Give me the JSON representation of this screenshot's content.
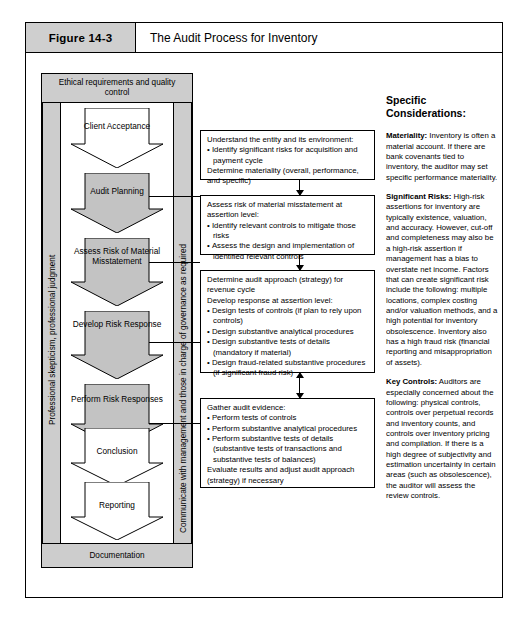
{
  "figure": {
    "number": "Figure 14-3",
    "title": "The Audit Process for Inventory"
  },
  "flow_panel": {
    "top_band": "Ethical requirements and quality control",
    "bottom_band": "Documentation",
    "left_vertical_label": "Professional skepticism, professional judgment",
    "right_vertical_label": "Communicate with management and those in charge of governance as required",
    "steps": [
      {
        "label": "Client Acceptance",
        "fill": "#ffffff"
      },
      {
        "label": "Audit Planning",
        "fill": "#c3c3c3"
      },
      {
        "label": "Assess Risk of Material Misstatement",
        "fill": "#c3c3c3"
      },
      {
        "label": "Develop Risk Response",
        "fill": "#c3c3c3"
      },
      {
        "label": "Perform Risk Responses",
        "fill": "#c3c3c3"
      },
      {
        "label": "Conclusion",
        "fill": "#ffffff"
      },
      {
        "label": "Reporting",
        "fill": "#ffffff"
      }
    ]
  },
  "process_boxes": [
    {
      "lead": "Understand the entity and its environment:",
      "bullets": [
        "Identify significant risks for acquisition and payment cycle"
      ],
      "tail": "Determine materiality (overall, performance, and specific)"
    },
    {
      "lead": "Assess risk of material misstatement at assertion level:",
      "bullets": [
        "Identify relevant controls to mitigate those risks",
        "Assess the design and implementation of identified relevant controls"
      ],
      "tail": ""
    },
    {
      "lead": "Determine audit approach (strategy) for revenue cycle",
      "lead2": "Develop response at assertion level:",
      "bullets": [
        "Design tests of controls (if plan to rely upon controls)",
        "Design substantive analytical procedures",
        "Design substantive tests of details (mandatory if material)",
        "Design fraud-related substantive procedures (if significant fraud risk)"
      ],
      "tail": ""
    },
    {
      "lead": "Gather audit evidence:",
      "bullets": [
        "Perform tests of controls",
        "Perform substantive analytical procedures",
        "Perform substantive tests of details (substantive tests of transactions and substantive tests of balances)"
      ],
      "tail": "Evaluate results and adjust audit approach (strategy) if necessary"
    }
  ],
  "right_column": {
    "heading": "Specific Considerations:",
    "sections": [
      {
        "term": "Materiality:",
        "body": " Inventory is often a material account. If there are bank covenants tied to inventory, the auditor may set specific performance materiality."
      },
      {
        "term": "Significant Risks:",
        "body": " High-risk assertions for inventory are typically existence, valuation, and accuracy. However, cut-off and completeness may also be a high-risk assertion if management has a bias to overstate net income. Factors that can create significant risk include the following: multiple locations, complex costing and/or valuation methods, and a high potential for inventory obsolescence. Inventory also has a high fraud risk (financial reporting and misappropriation of assets)."
      },
      {
        "term": "Key Controls:",
        "body": " Auditors are especially concerned about the following: physical controls, controls over perpetual records and inventory counts, and controls over inventory pricing and compilation. If there is a high degree of subjectivity and estimation uncertainty in certain areas (such as obsolescence), the auditor will assess the review controls."
      }
    ]
  },
  "colors": {
    "band_gray": "#cdcdcd",
    "panel_gray": "#b9b9b9",
    "arrow_gray": "#c3c3c3",
    "title_gray": "#cfcfcf",
    "line": "#000000"
  }
}
